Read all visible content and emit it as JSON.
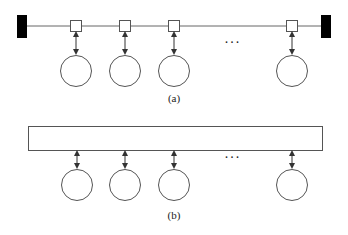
{
  "diagram": {
    "panel_a": {
      "label": "(a)",
      "description": "Bus topology with terminators and taps",
      "ellipsis": "...",
      "taps_x": [
        76,
        125,
        174,
        292
      ],
      "colors": {
        "line": "#555555",
        "terminator": "#000000",
        "node_fill": "#ffffff"
      }
    },
    "panel_b": {
      "label": "(b)",
      "description": "Shared medium bar with attached nodes",
      "ellipsis": "...",
      "nodes_x": [
        77,
        125,
        174,
        292
      ]
    }
  }
}
